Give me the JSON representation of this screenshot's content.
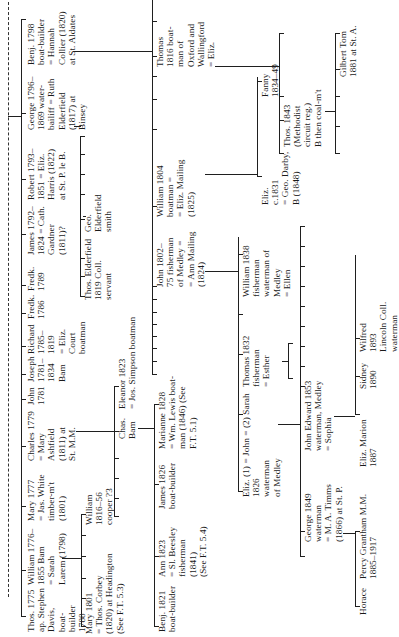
{
  "tree": {
    "generation1": [
      {
        "id": "thos-1775",
        "text": "Thos. 1775\nap. Stephen\nDavis,\nboat-\nbuilder\n1788"
      },
      {
        "id": "william-1776",
        "text": "William 1776–\n1855 Bam\n= Sarah\nLarem (1798)"
      },
      {
        "id": "mary-1777",
        "text": "Mary 1777\n= Jas. White\ntimber-m't\n(1801)"
      },
      {
        "id": "charles-1779",
        "text": "Charles 1779\n= Mary\nAshfield\n(1811) at\nSt. M.M."
      },
      {
        "id": "john-1781",
        "text": "John\n1781"
      },
      {
        "id": "joseph-1781",
        "text": "Joseph\n1781–\n1834\nBam"
      },
      {
        "id": "richard-1785",
        "text": "Richard\n1785–\n1819\n= Eliz.\nCourt\nboatman"
      },
      {
        "id": "fredk-1786",
        "text": "Fredk.\n1786"
      },
      {
        "id": "fredk-1789",
        "text": "Fredk.\n1789"
      },
      {
        "id": "james-1792",
        "text": "James 1792–\n1824 = Cath.\nGardner\n(1811)?"
      },
      {
        "id": "robert-1793",
        "text": "Robert 1793–\n1851 = Eliz.\nHarris (1822)\nat St. P. le B."
      },
      {
        "id": "george-1796",
        "text": "George 1796–\n1869 water-\nbailiff = Ruth\nElderfield\n(1817) at\nBinsey"
      },
      {
        "id": "benj-1798",
        "text": "Benj. 1798\nboat-builder\n= Hannah\nCollier (1820)\nat St. Aldates"
      }
    ],
    "william_children": [
      {
        "id": "mary-1801",
        "text": "Mary 1801\n= Thos. Corbey\n(1820) at Headington\n(See F.T. 5.3)"
      },
      {
        "id": "william-1816",
        "text": "William\n1816–56\ncooper ?3"
      }
    ],
    "charles_children": [
      {
        "id": "chas-bam",
        "text": "Chas.\nBam"
      },
      {
        "id": "eleanor-1823",
        "text": "Eleanor 1823\n= Jos. Simpson boatman"
      }
    ],
    "chas_children": [
      {
        "id": "benj-1821",
        "text": "Benj. 1821\nboat-builder"
      },
      {
        "id": "ann-1823",
        "text": "Ann 1823\n= Sl. Beesley\nfisherman\n(1841)\n(See F.T. 5.4)"
      },
      {
        "id": "james-1826",
        "text": "James 1826\nboat-builder"
      },
      {
        "id": "marianne-1828",
        "text": "Marianne 1828\n= Wm. Lewis boat-\nman (1846) (See\nF.T. 5.1)"
      }
    ],
    "george_children": [
      {
        "id": "thos-elderfield",
        "text": "Thos. Elderfield\n1819 Coll.\nservant"
      },
      {
        "id": "geo-elderfield",
        "text": "Geo.\nElderfield\nsmith"
      }
    ],
    "benj_children": [
      {
        "id": "john-1802",
        "text": "John 1802–\n75 fisherman\nof Medley =\n= Ann Mailing\n(1824)"
      },
      {
        "id": "william-1804",
        "text": "William 1804\nboatman =\n= Eliz. Mailing\n(1825)"
      },
      {
        "id": "thomas-1816",
        "text": "Thomas\n1816 boat-\nman of\nOxford and\nWallingford\n= Eliz."
      }
    ],
    "john_children": [
      {
        "id": "john-1826",
        "text": "Eliz. (1) = John = (2) Sarah\n1826\nwaterman\nof Medley"
      },
      {
        "id": "thomas-1832",
        "text": "Thomas 1832\nfisherman\n= Esther"
      },
      {
        "id": "william-1838",
        "text": "William 1838\nfisherman\nwaterman of\nMedley\n= Ellen"
      }
    ],
    "john1826_children": [
      {
        "id": "george-1849",
        "text": "George 1849\nwaterman\n= M. A. Timms\n(1866) at St. P."
      },
      {
        "id": "john-edward-1853",
        "text": "John Edward 1853\nwaterman, Medley\n= Sophia"
      }
    ],
    "george1849_children": [
      {
        "id": "horace",
        "text": "Horace"
      },
      {
        "id": "percy",
        "text": "Percy Grantham M.M.\n1885–1917"
      }
    ],
    "johnedward_children": [
      {
        "id": "eliz-marion",
        "text": "Eliz. Marion\n1887"
      },
      {
        "id": "sidney",
        "text": "Sidney\n1890"
      },
      {
        "id": "wilfred",
        "text": "Wilfred\n1893\nLincoln Coll.\nwaterman"
      }
    ],
    "william1804_children": [
      {
        "id": "eliz-1831",
        "text": "Eliz.\nc.1831\n= Geo. Darby,\nB (1848)"
      },
      {
        "id": "fanny",
        "text": "Fanny\n1834–49"
      }
    ],
    "thomas1816_children": [
      {
        "id": "thos-1843",
        "text": "Thos. 1843\n(Methodist\ncircuit reg.)\nB then coal-m't"
      },
      {
        "id": "gilbert-tom",
        "text": "Gilbert Tom\n1881 at St. A."
      }
    ]
  }
}
